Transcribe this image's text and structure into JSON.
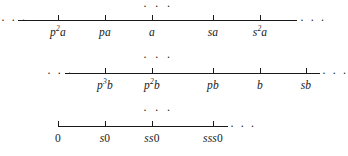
{
  "figure": {
    "type": "number-line-diagram",
    "background_color": "#ffffff",
    "ink_color": "#1a1a1a",
    "ellipsis": "· · ·",
    "gap_markers": [
      {
        "name": "top-ellipsis",
        "text": "· · ·",
        "x": 158,
        "y": 1
      },
      {
        "name": "middle-ellipsis-1",
        "text": "· · ·",
        "x": 158,
        "y": 52
      },
      {
        "name": "middle-ellipsis-2",
        "text": "· · ·",
        "x": 158,
        "y": 105
      }
    ],
    "rows": [
      {
        "id": "row-a",
        "line_y": 20,
        "line_x1": 18,
        "line_x2": 297,
        "label_y": 26,
        "left_ellipsis": {
          "text": "· · ·",
          "x": 1,
          "y": 14
        },
        "right_ellipsis": {
          "text": "· · ·",
          "x": 300,
          "y": 14
        },
        "ticks": [
          {
            "x": 58,
            "label_main": "p",
            "label_sup": "2",
            "label_tail": "a",
            "plain": "p2a"
          },
          {
            "x": 105,
            "label_main": "pa",
            "label_sup": "",
            "label_tail": "",
            "plain": "pa"
          },
          {
            "x": 152,
            "label_main": "a",
            "label_sup": "",
            "label_tail": "",
            "plain": "a"
          },
          {
            "x": 213,
            "label_main": "sa",
            "label_sup": "",
            "label_tail": "",
            "plain": "sa"
          },
          {
            "x": 260,
            "label_main": "s",
            "label_sup": "2",
            "label_tail": "a",
            "plain": "s2a"
          }
        ]
      },
      {
        "id": "row-b",
        "line_y": 73,
        "line_x1": 65,
        "line_x2": 320,
        "label_y": 79,
        "left_ellipsis": {
          "text": "· · ·",
          "x": 47,
          "y": 67
        },
        "right_ellipsis": {
          "text": "· · ·",
          "x": 322,
          "y": 67
        },
        "ticks": [
          {
            "x": 105,
            "label_main": "p",
            "label_sup": "3",
            "label_tail": "b",
            "plain": "p3b"
          },
          {
            "x": 152,
            "label_main": "p",
            "label_sup": "2",
            "label_tail": "b",
            "plain": "p2b"
          },
          {
            "x": 213,
            "label_main": "pb",
            "label_sup": "",
            "label_tail": "",
            "plain": "pb"
          },
          {
            "x": 260,
            "label_main": "b",
            "label_sup": "",
            "label_tail": "",
            "plain": "b"
          },
          {
            "x": 306,
            "label_main": "sb",
            "label_sup": "",
            "label_tail": "",
            "plain": "sb"
          }
        ]
      },
      {
        "id": "row-zero",
        "line_y": 126,
        "line_x1": 58,
        "line_x2": 228,
        "label_y": 132,
        "left_ellipsis": null,
        "right_ellipsis": {
          "text": "· · ·",
          "x": 230,
          "y": 120
        },
        "ticks": [
          {
            "x": 58,
            "label_main": "",
            "label_sup": "",
            "label_tail": "0",
            "plain": "0"
          },
          {
            "x": 105,
            "label_main": "s",
            "label_sup": "",
            "label_tail": "0",
            "plain": "s0"
          },
          {
            "x": 152,
            "label_main": "ss",
            "label_sup": "",
            "label_tail": "0",
            "plain": "ss0"
          },
          {
            "x": 213,
            "label_main": "sss",
            "label_sup": "",
            "label_tail": "0",
            "plain": "sss0"
          }
        ]
      }
    ]
  }
}
